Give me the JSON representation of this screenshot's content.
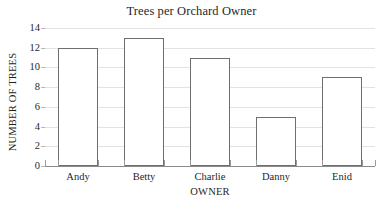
{
  "chart_data": {
    "type": "bar",
    "title": "Trees per Orchard Owner",
    "xlabel": "OWNER",
    "ylabel": "NUMBER OF TREES",
    "categories": [
      "Andy",
      "Betty",
      "Charlie",
      "Danny",
      "Enid"
    ],
    "values": [
      12,
      13,
      11,
      5,
      9
    ],
    "ylim": [
      0,
      14
    ],
    "ytick_labels": [
      "0",
      "2",
      "4",
      "6",
      "8",
      "10",
      "12",
      "14"
    ],
    "ytick_values": [
      0,
      2,
      4,
      6,
      8,
      10,
      12,
      14
    ],
    "grid": "horizontal",
    "legend": "none",
    "bar_fill_color": "#ffffff",
    "bar_border_color": "#6e6e6e",
    "gridline_color": "#e2e2e2",
    "axis_color": "#8a8a8a",
    "text_color": "#1f1f1f",
    "background_color": "#ffffff"
  },
  "artifacts": {
    "top_clipped_text": "........ ..... ... ....... ......."
  }
}
